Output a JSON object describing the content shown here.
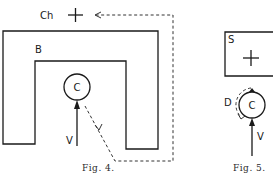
{
  "figures": [
    {
      "id": "fig4",
      "caption": "Fig. 4.",
      "labels": {
        "crosshair": "Ch",
        "barrier": "B",
        "circle": "C",
        "velocity": "V"
      }
    },
    {
      "id": "fig5",
      "caption": "Fig. 5.",
      "labels": {
        "screen": "S",
        "circle": "C",
        "deflection": "D",
        "velocity": "V"
      }
    }
  ],
  "colors": {
    "ink": "#1a1a1a",
    "background": "#ffffff"
  }
}
